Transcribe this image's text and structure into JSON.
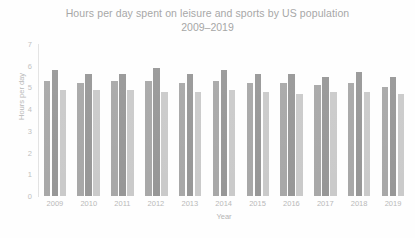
{
  "chart_data": {
    "type": "bar",
    "title": "Hours per day spent on leisure and sports by US population",
    "subtitle": "2009–2019",
    "xlabel": "Year",
    "ylabel": "Hours per day",
    "ylim": [
      0,
      7
    ],
    "yticks": [
      7,
      6,
      5,
      4,
      3,
      2,
      1,
      0
    ],
    "grid": false,
    "legend_position": "none",
    "categories": [
      "2009",
      "2010",
      "2011",
      "2012",
      "2013",
      "2014",
      "2015",
      "2016",
      "2017",
      "2018",
      "2019"
    ],
    "series": [
      {
        "name": "Total",
        "color": "#a6a6a6",
        "values": [
          5.3,
          5.2,
          5.3,
          5.3,
          5.2,
          5.3,
          5.2,
          5.2,
          5.1,
          5.2,
          5.0
        ]
      },
      {
        "name": "Men",
        "color": "#959595",
        "values": [
          5.8,
          5.6,
          5.6,
          5.9,
          5.6,
          5.8,
          5.6,
          5.6,
          5.5,
          5.7,
          5.5
        ]
      },
      {
        "name": "Women",
        "color": "#c9c9c9",
        "values": [
          4.9,
          4.9,
          4.9,
          4.8,
          4.8,
          4.9,
          4.8,
          4.7,
          4.8,
          4.8,
          4.7
        ]
      }
    ]
  },
  "colors": {
    "series_total": "#a6a6a6",
    "series_men": "#959595",
    "series_women": "#c9c9c9",
    "text": "#9d9d9d",
    "axis": "#e2e2e2",
    "background": "#ffffff"
  }
}
